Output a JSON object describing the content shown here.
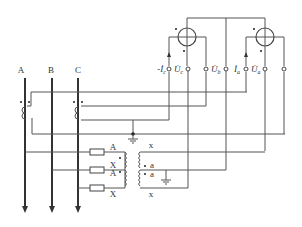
{
  "diagram": {
    "type": "three-phase meter wiring diagram",
    "buses": [
      {
        "label": "A"
      },
      {
        "label": "B"
      },
      {
        "label": "C"
      }
    ],
    "meter_terminals": {
      "neg_ic": "-İ",
      "neg_ic_sub": "c",
      "uc": "U̇",
      "uc_sub": "c",
      "ub": "U̇",
      "ub_sub": "b",
      "ia": "İ",
      "ia_sub": "a",
      "ua": "U̇",
      "ua_sub": "a"
    },
    "pt_labels": {
      "primary_top": "A",
      "primary_x1": "X",
      "primary_a2": "A",
      "primary_x2": "X",
      "secondary_top": "x",
      "secondary_a1": "a",
      "secondary_a2": "a",
      "secondary_bottom": "x"
    },
    "colors": {
      "line": "#555555",
      "bus": "#333333",
      "background": "#ffffff"
    }
  }
}
